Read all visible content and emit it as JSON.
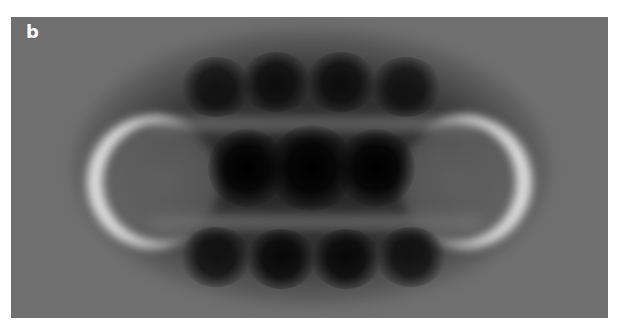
{
  "panel": {
    "label": "b",
    "background_color": "#6f6f6f",
    "description": "Grayscale microscopy image of an elongated molecule with bright end lobes and dark circular features"
  }
}
